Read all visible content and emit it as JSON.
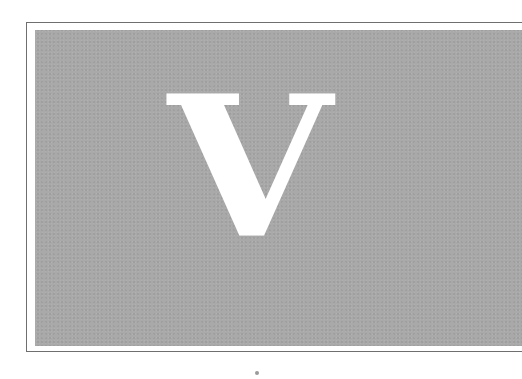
{
  "page": {
    "letter": "V"
  },
  "colors": {
    "background": "#ffffff",
    "frame_border": "#6f6f6f",
    "panel_fill": "#a9a9a9",
    "letter_fill": "#ffffff"
  }
}
